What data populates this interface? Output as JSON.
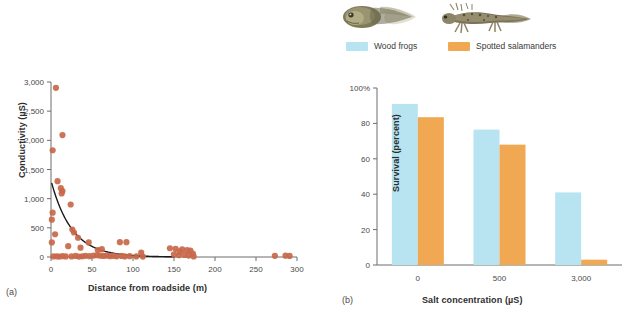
{
  "panels": {
    "a": {
      "label": "(a)",
      "xlabel": "Distance from roadside (m)",
      "ylabel": "Conductivity (µS)"
    },
    "b": {
      "label": "(b)",
      "xlabel": "Salt concentration (µS)",
      "ylabel": "Survival (percent)"
    }
  },
  "legend": {
    "items": [
      {
        "label": "Wood frogs",
        "color": "#b8e4f2",
        "icon": "tadpole-illustration"
      },
      {
        "label": "Spotted salamanders",
        "color": "#f0a852",
        "icon": "salamander-larva-illustration"
      }
    ]
  },
  "colors": {
    "point": "#c8684a",
    "curve": "#1a1a1a",
    "axis": "#6d6d6d",
    "wood_frogs": "#b8e4f2",
    "spotted_salamanders": "#f0a852"
  },
  "chart_data": [
    {
      "type": "scatter",
      "title": "",
      "xlabel": "Distance from roadside (m)",
      "ylabel": "Conductivity (µS)",
      "xlim": [
        0,
        300
      ],
      "ylim": [
        0,
        3000
      ],
      "xticks": [
        0,
        50,
        100,
        150,
        200,
        250,
        300
      ],
      "xtick_labels": [
        "0",
        "50",
        "100",
        "150",
        "200",
        "250",
        "300"
      ],
      "yticks": [
        0,
        500,
        1000,
        1500,
        2000,
        2500,
        3000
      ],
      "ytick_labels": [
        "0",
        "500",
        "1,000",
        "1,500",
        "2,000",
        "2,500",
        "3,000"
      ],
      "grid": false,
      "legend": "none",
      "marker_color": "#c8684a",
      "points": [
        [
          6,
          2900
        ],
        [
          2,
          1830
        ],
        [
          14,
          2090
        ],
        [
          8,
          1300
        ],
        [
          12,
          1180
        ],
        [
          14,
          1130
        ],
        [
          13,
          1090
        ],
        [
          24,
          900
        ],
        [
          2,
          760
        ],
        [
          1,
          640
        ],
        [
          26,
          470
        ],
        [
          28,
          420
        ],
        [
          5,
          390
        ],
        [
          1,
          250
        ],
        [
          33,
          330
        ],
        [
          46,
          250
        ],
        [
          84,
          255
        ],
        [
          92,
          255
        ],
        [
          21,
          185
        ],
        [
          36,
          160
        ],
        [
          57,
          120
        ],
        [
          62,
          135
        ],
        [
          110,
          75
        ],
        [
          145,
          150
        ],
        [
          152,
          140
        ],
        [
          160,
          130
        ],
        [
          157,
          95
        ],
        [
          166,
          120
        ],
        [
          170,
          110
        ],
        [
          173,
          60
        ],
        [
          150,
          45
        ],
        [
          156,
          30
        ],
        [
          163,
          35
        ],
        [
          168,
          25
        ],
        [
          174,
          10
        ],
        [
          3,
          10
        ],
        [
          7,
          12
        ],
        [
          10,
          8
        ],
        [
          14,
          15
        ],
        [
          18,
          10
        ],
        [
          25,
          10
        ],
        [
          30,
          18
        ],
        [
          34,
          8
        ],
        [
          38,
          12
        ],
        [
          42,
          20
        ],
        [
          47,
          15
        ],
        [
          52,
          25
        ],
        [
          56,
          30
        ],
        [
          60,
          22
        ],
        [
          64,
          18
        ],
        [
          68,
          25
        ],
        [
          72,
          15
        ],
        [
          76,
          20
        ],
        [
          80,
          12
        ],
        [
          86,
          18
        ],
        [
          90,
          10
        ],
        [
          96,
          14
        ],
        [
          104,
          10
        ],
        [
          112,
          8
        ],
        [
          273,
          20
        ],
        [
          286,
          22
        ],
        [
          291,
          18
        ]
      ],
      "fit_curve": {
        "type": "exponential_decay",
        "y0": 1310,
        "decay_per_m": 0.0395,
        "x_start": 1,
        "x_end": 150
      }
    },
    {
      "type": "bar",
      "title": "",
      "xlabel": "Salt concentration (µS)",
      "ylabel": "Survival (percent)",
      "categories": [
        "0",
        "500",
        "3,000"
      ],
      "ylim": [
        0,
        100
      ],
      "yticks": [
        0,
        20,
        40,
        60,
        80,
        100
      ],
      "ytick_labels": [
        "0",
        "20",
        "40",
        "60",
        "80",
        "100%"
      ],
      "grid": false,
      "legend": "top",
      "series": [
        {
          "name": "Wood frogs",
          "color": "#b8e4f2",
          "values": [
            91,
            76.5,
            41
          ]
        },
        {
          "name": "Spotted salamanders",
          "color": "#f0a852",
          "values": [
            83.5,
            68,
            3
          ]
        }
      ]
    }
  ]
}
